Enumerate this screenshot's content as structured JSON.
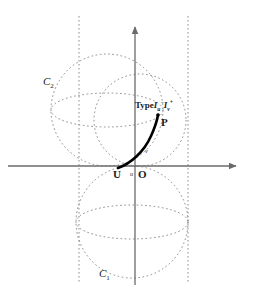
{
  "figure": {
    "colors": {
      "axis": "#6b6b6b",
      "dotted": "#8a8a8a",
      "curve": "#000000",
      "text": "#1a1a1a",
      "background": "#ffffff"
    },
    "axes": {
      "x_axis": {
        "name": "x-axis",
        "x1": 8,
        "y1": 166,
        "x2": 240,
        "y2": 166,
        "arrow": "right"
      },
      "y_axis": {
        "name": "y-axis",
        "x1": 135,
        "y1": 285,
        "x2": 135,
        "y2": 22,
        "arrow": "up"
      }
    },
    "tangent_lines": [
      {
        "name": "left-tangent-line",
        "x": 79,
        "y1": 16,
        "y2": 284
      },
      {
        "name": "right-tangent-line",
        "x": 188,
        "y1": 16,
        "y2": 284
      }
    ],
    "circles": [
      {
        "name": "circle-c2-large",
        "cx": 107,
        "cy": 110,
        "r": 56
      },
      {
        "name": "circle-upper-small",
        "cx": 140,
        "cy": 120,
        "r": 46
      },
      {
        "name": "circle-c1-lower",
        "cx": 132,
        "cy": 222,
        "r": 56
      }
    ],
    "ellipse_arcs": [
      {
        "name": "equator-arc-upper",
        "cx": 107,
        "cy": 110,
        "rx": 56,
        "ry": 17
      },
      {
        "name": "equator-arc-lower",
        "cx": 132,
        "cy": 222,
        "rx": 56,
        "ry": 17
      }
    ],
    "curve": {
      "name": "type-one-curve",
      "description": "bold curve from U through origin region up to P",
      "path": "M 119 167 C 129 163 143 152 150 135 C 155 124 157 118 158 116"
    },
    "points": [
      {
        "name": "point-p",
        "x": 158,
        "y": 116,
        "label": "P"
      }
    ],
    "labels": {
      "c2": "C",
      "c2_sub": "2",
      "c1": "C",
      "c1_sub": "1",
      "point_u": "U",
      "point_o": "O",
      "point_p": "P",
      "small_u": "u",
      "small_v": "v",
      "type_text": "Type",
      "type_symbol_1": "I",
      "type_symbol_1_sub": "u",
      "type_symbol_1_sup": "−",
      "type_symbol_2": "I",
      "type_symbol_2_sub": "v",
      "type_symbol_2_sup": "+"
    }
  }
}
